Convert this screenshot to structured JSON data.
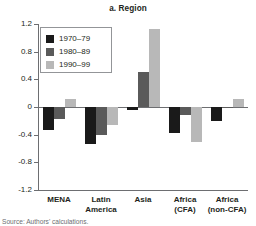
{
  "chart_data": {
    "type": "bar",
    "title": "a. Region",
    "xlabel": "",
    "ylabel": "",
    "ylim": [
      -1.2,
      1.2
    ],
    "yticks": [
      "1.2",
      "0.8",
      "0.4",
      "0",
      "-0.4",
      "-0.8",
      "-1.2"
    ],
    "ytick_values": [
      1.2,
      0.8,
      0.4,
      0,
      -0.4,
      -0.8,
      -1.2
    ],
    "grid": false,
    "legend_position": "top-left",
    "categories": [
      "MENA",
      "Latin America",
      "Asia",
      "Africa (CFA)",
      "Africa (non-CFA)"
    ],
    "category_lines": [
      [
        "MENA",
        ""
      ],
      [
        "Latin",
        "America"
      ],
      [
        "Asia",
        ""
      ],
      [
        "Africa",
        "(CFA)"
      ],
      [
        "Africa",
        "(non-CFA)"
      ]
    ],
    "series": [
      {
        "name": "1970–79",
        "color": "#1a1a1a",
        "values": [
          -0.33,
          -0.54,
          -0.04,
          -0.38,
          -0.2
        ]
      },
      {
        "name": "1980–89",
        "color": "#5a5a5a",
        "values": [
          -0.18,
          -0.4,
          0.51,
          -0.12,
          -0.02
        ]
      },
      {
        "name": "1990–99",
        "color": "#b8b8b8",
        "values": [
          0.12,
          -0.26,
          1.13,
          -0.5,
          0.11
        ]
      }
    ]
  },
  "title": "a. Region",
  "legend": {
    "items": [
      {
        "label": "1970–79",
        "color": "#1a1a1a"
      },
      {
        "label": "1980–89",
        "color": "#5a5a5a"
      },
      {
        "label": "1990–99",
        "color": "#b8b8b8"
      }
    ]
  },
  "axis": {
    "y_tick_labels": [
      "1.2",
      "0.8",
      "0.4",
      "0",
      "-0.4",
      "-0.8",
      "-1.2"
    ]
  },
  "source": {
    "text": "Source: Authors' calculations."
  }
}
